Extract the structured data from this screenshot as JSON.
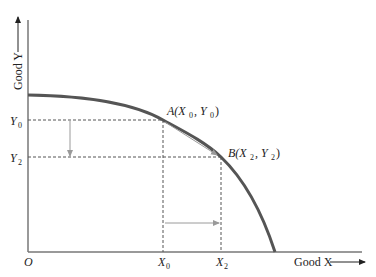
{
  "diagram": {
    "type": "production-possibilities-frontier",
    "colors": {
      "curve": "#555555",
      "axis": "#777777",
      "dashed": "#555555",
      "shift_arrow": "#9a9a9a",
      "text": "#222222"
    },
    "axes": {
      "origin_label": "O",
      "x_axis_label": "Good X",
      "y_axis_label": "Good Y"
    },
    "points": [
      {
        "name": "A",
        "label": "A(X",
        "x_sym": "0",
        "y_sym": "0",
        "x_label": "X",
        "x_sub": "0",
        "y_label": "Y",
        "y_sub": "0"
      },
      {
        "name": "B",
        "label": "B(X",
        "x_sym": "2",
        "y_sym": "2",
        "x_label": "X",
        "x_sub": "2",
        "y_label": "Y",
        "y_sub": "2"
      }
    ],
    "annotations": {
      "y_decrease_arrow": "Y0 to Y2 (downward)",
      "x_increase_arrow": "X0 to X2 (rightward)",
      "movement_arrow": "A to B along frontier"
    }
  }
}
